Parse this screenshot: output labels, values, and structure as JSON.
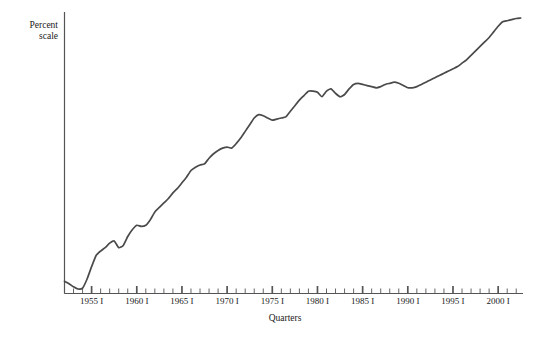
{
  "chart_data": {
    "type": "line",
    "title": "",
    "xlabel": "Quarters",
    "ylabel": "Percent\nscale",
    "grid": false,
    "legend": false,
    "xlim": [
      1952.0,
      2002.75
    ],
    "ylim": [
      0,
      100
    ],
    "tick_labels": [
      "1955 I",
      "1960 I",
      "1965 I",
      "1970 I",
      "1975 I",
      "1980 I",
      "1985 I",
      "1990 I",
      "1995 I",
      "2000 I"
    ],
    "tick_years": [
      1955,
      1960,
      1965,
      1970,
      1975,
      1980,
      1985,
      1990,
      1995,
      2000
    ],
    "minor_tick_interval_years": 1,
    "line_color": "#4a4a4a",
    "axis_color": "#555555",
    "series": [
      {
        "name": "Real GDP (log percent scale)",
        "x": [
          1952.0,
          1952.5,
          1953.0,
          1953.5,
          1954.0,
          1954.5,
          1955.0,
          1955.5,
          1956.0,
          1956.5,
          1957.0,
          1957.5,
          1958.0,
          1958.5,
          1959.0,
          1959.5,
          1960.0,
          1960.5,
          1961.0,
          1961.5,
          1962.0,
          1962.5,
          1963.0,
          1963.5,
          1964.0,
          1964.5,
          1965.0,
          1965.5,
          1966.0,
          1966.5,
          1967.0,
          1967.5,
          1968.0,
          1968.5,
          1969.0,
          1969.5,
          1970.0,
          1970.5,
          1971.0,
          1971.5,
          1972.0,
          1972.5,
          1973.0,
          1973.5,
          1974.0,
          1974.5,
          1975.0,
          1975.5,
          1976.0,
          1976.5,
          1977.0,
          1977.5,
          1978.0,
          1978.5,
          1979.0,
          1979.5,
          1980.0,
          1980.5,
          1981.0,
          1981.5,
          1982.0,
          1982.5,
          1983.0,
          1983.5,
          1984.0,
          1984.5,
          1985.0,
          1985.5,
          1986.0,
          1986.5,
          1987.0,
          1987.5,
          1988.0,
          1988.5,
          1989.0,
          1989.5,
          1990.0,
          1990.5,
          1991.0,
          1991.5,
          1992.0,
          1992.5,
          1993.0,
          1993.5,
          1994.0,
          1994.5,
          1995.0,
          1995.5,
          1996.0,
          1996.5,
          1997.0,
          1997.5,
          1998.0,
          1998.5,
          1999.0,
          1999.5,
          2000.0,
          2000.5,
          2001.0,
          2001.5,
          2002.0,
          2002.5
        ],
        "y": [
          5.5,
          4.4,
          3.0,
          2.0,
          2.4,
          6.5,
          12.0,
          17.0,
          19.0,
          20.5,
          22.5,
          23.5,
          20.5,
          21.5,
          25.5,
          28.5,
          30.5,
          30.0,
          30.5,
          33.0,
          36.5,
          38.5,
          40.5,
          42.5,
          45.0,
          47.0,
          49.5,
          52.0,
          55.0,
          56.5,
          57.5,
          58.0,
          60.5,
          62.5,
          64.0,
          65.0,
          65.5,
          65.0,
          67.0,
          69.5,
          72.5,
          75.5,
          78.5,
          80.0,
          79.5,
          78.5,
          77.5,
          78.0,
          78.5,
          79.0,
          81.5,
          84.0,
          86.5,
          88.5,
          90.5,
          90.5,
          90.0,
          88.0,
          90.5,
          91.5,
          89.5,
          88.0,
          89.0,
          91.5,
          93.5,
          94.0,
          93.5,
          93.0,
          92.5,
          92.0,
          92.5,
          93.5,
          94.0,
          94.5,
          94.0,
          93.0,
          92.0,
          92.0,
          92.5,
          93.5,
          94.5,
          95.5,
          96.5,
          97.5,
          98.5,
          99.5,
          100.5,
          101.5,
          103.0,
          104.5,
          106.5,
          108.5,
          110.5,
          112.5,
          114.5,
          117.0,
          119.5,
          121.5,
          122.0,
          122.5,
          123.0,
          123.2
        ]
      }
    ]
  },
  "labels": {
    "y_axis_title": "Percent\nscale",
    "x_axis_title": "Quarters"
  }
}
